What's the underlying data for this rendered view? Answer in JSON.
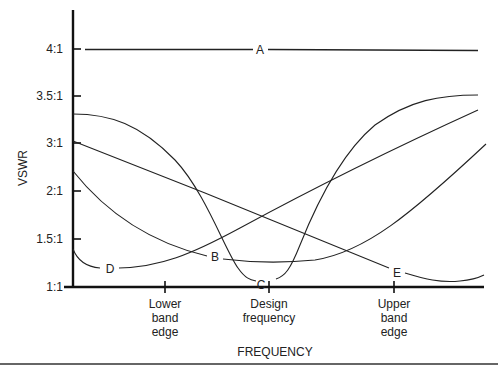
{
  "chart_data": {
    "type": "line",
    "title": "",
    "xlabel": "FREQUENCY",
    "ylabel": "VSWR",
    "y_ticks": [
      "1:1",
      "1.5:1",
      "2:1",
      "3:1",
      "3.5:1",
      "4:1"
    ],
    "x_ticks": [
      {
        "lines": [
          "Lower",
          "band",
          "edge"
        ]
      },
      {
        "lines": [
          "Design",
          "frequency"
        ]
      },
      {
        "lines": [
          "Upper",
          "band",
          "edge"
        ]
      }
    ],
    "x_categories": [
      "Band start",
      "Lower band edge",
      "Design frequency",
      "Upper band edge",
      "Band end"
    ],
    "series": [
      {
        "name": "A",
        "description": "Flat VSWR across band",
        "values": [
          4.0,
          4.0,
          4.0,
          4.0,
          4.0
        ]
      },
      {
        "name": "B",
        "description": "Broad minimum near design frequency",
        "values": [
          2.4,
          1.6,
          1.25,
          1.9,
          3.0
        ]
      },
      {
        "name": "C",
        "description": "Sharp minimum at design frequency",
        "values": [
          3.3,
          2.9,
          1.05,
          2.9,
          3.5
        ]
      },
      {
        "name": "D",
        "description": "Minimum near low end, rising with frequency",
        "values": [
          1.4,
          1.25,
          1.6,
          2.6,
          3.3
        ]
      },
      {
        "name": "E",
        "description": "Decreasing with frequency, minimum above upper band edge",
        "values": [
          3.0,
          2.5,
          1.8,
          1.15,
          1.1
        ]
      }
    ],
    "grid": false,
    "legend": "inline labels on curves"
  }
}
